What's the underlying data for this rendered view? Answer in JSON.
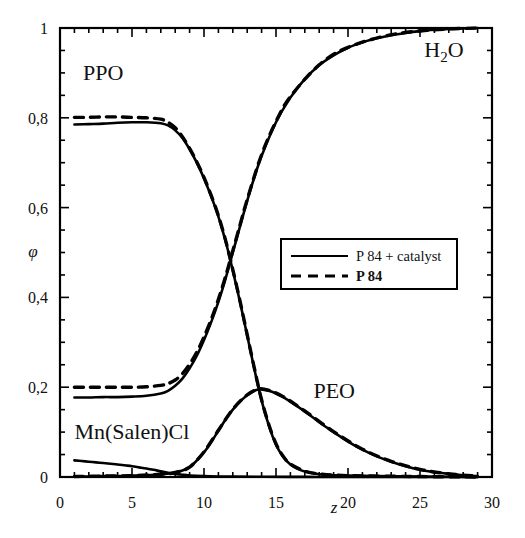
{
  "chart_data": {
    "type": "line",
    "title": "",
    "subtitle": "",
    "xlabel": "z",
    "ylabel": "φ",
    "xlim": [
      0,
      30
    ],
    "ylim": [
      0,
      1
    ],
    "xticks": [
      0,
      5,
      10,
      15,
      20,
      25,
      30
    ],
    "xticklabels": [
      "0",
      "5",
      "10",
      "15",
      "20",
      "25",
      "30"
    ],
    "yticks": [
      0,
      0.2,
      0.4,
      0.6,
      0.8,
      1
    ],
    "yticklabels": [
      "0",
      "0,2",
      "0,4",
      "0,6",
      "0,8",
      "1"
    ],
    "x_minor_tick_step": 1,
    "y_minor_tick_step": 0.05,
    "grid": false,
    "decimal_separator": ",",
    "legend": {
      "position": "center-right",
      "entries": [
        {
          "label": "P 84 + catalyst",
          "style": "solid",
          "bold": false
        },
        {
          "label": "P 84",
          "style": "dashed",
          "bold": true
        }
      ]
    },
    "annotations": [
      {
        "text": "PPO",
        "x": 1.6,
        "y": 0.885,
        "name": "ppo"
      },
      {
        "text": "H2O",
        "x": 25.3,
        "y": 0.935,
        "name": "h2o",
        "rich": "H₂O"
      },
      {
        "text": "PEO",
        "x": 17.6,
        "y": 0.175,
        "name": "peo"
      },
      {
        "text": "Mn(Salen)Cl",
        "x": 1.0,
        "y": 0.085,
        "name": "mn-salen-cl"
      }
    ],
    "series": [
      {
        "name": "PPO",
        "style": "solid",
        "legend_group": "P 84 + catalyst",
        "x": [
          1,
          2,
          3,
          4,
          5,
          6,
          7,
          7.5,
          8,
          8.5,
          9,
          9.5,
          10,
          10.5,
          11,
          11.5,
          12,
          12.5,
          13,
          13.5,
          14,
          14.5,
          15,
          15.5,
          16,
          16.5,
          17,
          18,
          19,
          20,
          22,
          25,
          29
        ],
        "y": [
          0.785,
          0.786,
          0.787,
          0.789,
          0.79,
          0.79,
          0.788,
          0.783,
          0.772,
          0.755,
          0.73,
          0.7,
          0.665,
          0.625,
          0.58,
          0.525,
          0.46,
          0.39,
          0.315,
          0.24,
          0.17,
          0.115,
          0.072,
          0.045,
          0.028,
          0.018,
          0.012,
          0.006,
          0.004,
          0.003,
          0.002,
          0.001,
          0.0
        ]
      },
      {
        "name": "PPO",
        "style": "dashed",
        "legend_group": "P 84",
        "x": [
          1,
          2,
          3,
          4,
          5,
          6,
          7,
          7.5,
          8,
          8.5,
          9,
          9.5,
          10,
          10.5,
          11,
          11.5,
          12,
          12.5,
          13,
          13.5,
          14,
          14.5,
          15,
          15.5,
          16,
          17,
          18,
          20,
          25,
          29
        ],
        "y": [
          0.801,
          0.801,
          0.802,
          0.802,
          0.801,
          0.8,
          0.797,
          0.79,
          0.778,
          0.758,
          0.732,
          0.702,
          0.667,
          0.627,
          0.582,
          0.527,
          0.462,
          0.392,
          0.317,
          0.242,
          0.172,
          0.117,
          0.074,
          0.046,
          0.029,
          0.013,
          0.007,
          0.003,
          0.001,
          0.0
        ]
      },
      {
        "name": "H2O",
        "style": "solid",
        "legend_group": "P 84 + catalyst",
        "x": [
          1,
          2,
          3,
          4,
          5,
          6,
          7,
          7.5,
          8,
          8.5,
          9,
          9.5,
          10,
          10.5,
          11,
          11.5,
          12,
          12.5,
          13,
          13.5,
          14,
          15,
          16,
          17,
          18,
          19,
          20,
          21,
          22,
          23,
          24,
          25,
          26,
          27,
          28,
          29
        ],
        "y": [
          0.177,
          0.177,
          0.178,
          0.178,
          0.179,
          0.181,
          0.186,
          0.192,
          0.203,
          0.219,
          0.242,
          0.27,
          0.305,
          0.345,
          0.39,
          0.442,
          0.5,
          0.558,
          0.615,
          0.668,
          0.715,
          0.79,
          0.845,
          0.886,
          0.917,
          0.939,
          0.956,
          0.968,
          0.977,
          0.984,
          0.989,
          0.993,
          0.996,
          0.998,
          0.999,
          1.0
        ]
      },
      {
        "name": "H2O",
        "style": "dashed",
        "legend_group": "P 84",
        "x": [
          1,
          2,
          3,
          4,
          5,
          6,
          7,
          7.5,
          8,
          8.5,
          9,
          9.5,
          10,
          10.5,
          11,
          11.5,
          12,
          12.5,
          13,
          14,
          15,
          16,
          18,
          20,
          23,
          26,
          29
        ],
        "y": [
          0.2,
          0.2,
          0.2,
          0.2,
          0.2,
          0.201,
          0.204,
          0.208,
          0.216,
          0.23,
          0.251,
          0.278,
          0.312,
          0.351,
          0.396,
          0.447,
          0.504,
          0.561,
          0.618,
          0.718,
          0.792,
          0.847,
          0.918,
          0.957,
          0.985,
          0.996,
          1.0
        ]
      },
      {
        "name": "PEO",
        "style": "solid",
        "legend_group": "P 84 + catalyst",
        "x": [
          1,
          2,
          3,
          4,
          5,
          6,
          7,
          8,
          9,
          10,
          10.5,
          11,
          11.5,
          12,
          12.5,
          13,
          13.5,
          13.8,
          14,
          14.5,
          15,
          15.5,
          16,
          17,
          18,
          19,
          20,
          21,
          22,
          23,
          24,
          25,
          26,
          27,
          28,
          29
        ],
        "y": [
          0.001,
          0.001,
          0.002,
          0.002,
          0.003,
          0.004,
          0.006,
          0.01,
          0.022,
          0.055,
          0.078,
          0.103,
          0.128,
          0.15,
          0.168,
          0.182,
          0.192,
          0.195,
          0.195,
          0.192,
          0.186,
          0.178,
          0.168,
          0.146,
          0.122,
          0.1,
          0.079,
          0.061,
          0.046,
          0.034,
          0.024,
          0.016,
          0.011,
          0.007,
          0.004,
          0.002
        ]
      },
      {
        "name": "PEO",
        "style": "dashed",
        "legend_group": "P 84",
        "x": [
          1,
          3,
          5,
          7,
          8,
          9,
          10,
          11,
          12,
          13,
          13.8,
          14.5,
          15.5,
          17,
          19,
          21,
          23,
          25,
          27,
          29
        ],
        "y": [
          0.001,
          0.002,
          0.003,
          0.006,
          0.01,
          0.022,
          0.056,
          0.104,
          0.151,
          0.183,
          0.196,
          0.193,
          0.179,
          0.147,
          0.101,
          0.062,
          0.035,
          0.017,
          0.007,
          0.002
        ]
      },
      {
        "name": "Mn(Salen)Cl",
        "style": "solid",
        "legend_group": "P 84 + catalyst",
        "x": [
          1,
          1.5,
          2,
          2.5,
          3,
          3.5,
          4,
          4.5,
          5,
          5.5,
          6,
          6.5,
          7,
          7.5,
          8,
          8.5,
          9,
          10,
          11,
          12,
          14,
          17,
          20,
          25,
          29
        ],
        "y": [
          0.037,
          0.0355,
          0.034,
          0.0325,
          0.031,
          0.0295,
          0.028,
          0.026,
          0.024,
          0.0215,
          0.019,
          0.016,
          0.0125,
          0.0095,
          0.007,
          0.005,
          0.0035,
          0.002,
          0.0012,
          0.0008,
          0.0004,
          0.0002,
          0.0001,
          0.0,
          0.0
        ]
      }
    ]
  },
  "axes": {
    "y_axis_label": "φ",
    "x_axis_label": "z"
  },
  "colors": {
    "line": "#000000",
    "frame": "#000000",
    "background": "#ffffff",
    "text": "#111111"
  }
}
